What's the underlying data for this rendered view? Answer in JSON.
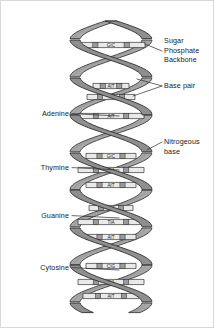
{
  "figure": {
    "canvas": {
      "width": 214,
      "height": 328
    },
    "background_color": "#ffffff",
    "border_color": "#d8d8d8"
  },
  "colors": {
    "ribbon_front": "#8f8f8f",
    "ribbon_back": "#a8a8a8",
    "ribbon_outline": "#2e2e2e",
    "rung_fill": "#e9e9e9",
    "rung_outline": "#333333",
    "rung_node": "#9a9a9a",
    "label_text": "#1a1a1a",
    "leader_line": "#2b2b2b"
  },
  "labels_left": [
    {
      "id": "adenine",
      "text": "Adenine",
      "x": 68,
      "y": 115,
      "leader_to_x": 118,
      "leader_to_y": 115
    },
    {
      "id": "thymine",
      "text": "Thymine",
      "x": 68,
      "y": 169,
      "leader_to_x": 118,
      "leader_to_y": 169
    },
    {
      "id": "guanine",
      "text": "Guanine",
      "x": 68,
      "y": 217,
      "leader_to_x": 118,
      "leader_to_y": 217
    },
    {
      "id": "cytosine",
      "text": "Cytosine",
      "x": 68,
      "y": 269,
      "leader_to_x": 118,
      "leader_to_y": 269
    }
  ],
  "labels_right": [
    {
      "id": "sugar-phosphate-backbone",
      "lines": [
        "Sugar",
        "Phosphate",
        "Backbone"
      ],
      "x": 163,
      "y": 42,
      "line_height": 9.5,
      "leader_from_x": 161,
      "leader_from_y": 50,
      "leader_to_x": 144,
      "leader_to_y": 43
    },
    {
      "id": "base-pair",
      "lines": [
        "Base pair"
      ],
      "x": 163,
      "y": 87,
      "line_height": 9.5,
      "leader_from_x": 161,
      "leader_from_y": 85,
      "leader_to_x": 132,
      "leader_to_y": 95
    },
    {
      "id": "nitrogeous-base",
      "lines": [
        "Nitrogeous",
        "base"
      ],
      "x": 163,
      "y": 143,
      "line_height": 9.5,
      "leader_from_x": 161,
      "leader_from_y": 141,
      "leader_to_x": 146,
      "leader_to_y": 149
    }
  ],
  "base_pairs": [
    {
      "index": 0,
      "y": 44,
      "left_base": "G",
      "right_base": "C",
      "half_width": 34,
      "visible_text": "G C"
    },
    {
      "index": 1,
      "y": 85,
      "left_base": "A",
      "right_base": "T",
      "half_width": 18,
      "visible_text": "A T"
    },
    {
      "index": 2,
      "y": 96,
      "left_base": "T",
      "right_base": "A",
      "half_width": 24,
      "visible_text": "T A"
    },
    {
      "index": 3,
      "y": 115,
      "left_base": "A",
      "right_base": "T",
      "half_width": 33,
      "visible_text": "A T"
    },
    {
      "index": 4,
      "y": 155,
      "left_base": "G",
      "right_base": "C",
      "half_width": 25,
      "visible_text": "G C"
    },
    {
      "index": 5,
      "y": 169,
      "left_base": "T",
      "right_base": "A",
      "half_width": 33,
      "visible_text": "T A"
    },
    {
      "index": 6,
      "y": 184,
      "left_base": "A",
      "right_base": "T",
      "half_width": 25,
      "visible_text": "A T"
    },
    {
      "index": 7,
      "y": 207,
      "left_base": "G",
      "right_base": "C",
      "half_width": 22,
      "visible_text": "G C"
    },
    {
      "index": 8,
      "y": 221,
      "left_base": "T",
      "right_base": "A",
      "half_width": 33,
      "visible_text": "T A"
    },
    {
      "index": 9,
      "y": 236,
      "left_base": "A",
      "right_base": "T",
      "half_width": 25,
      "visible_text": "A T"
    },
    {
      "index": 10,
      "y": 265,
      "left_base": "C",
      "right_base": "G",
      "half_width": 25,
      "visible_text": "C G"
    },
    {
      "index": 11,
      "y": 281,
      "left_base": "T",
      "right_base": "A",
      "half_width": 33,
      "visible_text": "T A"
    },
    {
      "index": 12,
      "y": 295,
      "left_base": "A",
      "right_base": "T",
      "half_width": 28,
      "visible_text": "A T"
    }
  ],
  "helix": {
    "center_x": 110,
    "top_y": 20,
    "bottom_y": 312,
    "amplitude": 36,
    "period": 75,
    "ribbon_thickness": 9,
    "turns": 4,
    "strand_a_phase": 0,
    "strand_b_phase": 3.14159
  }
}
